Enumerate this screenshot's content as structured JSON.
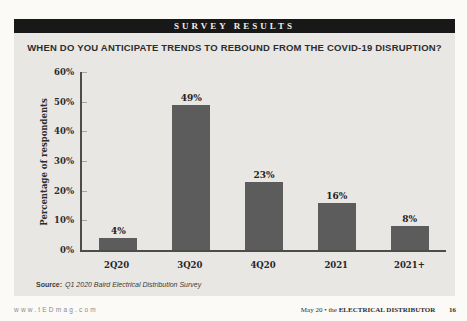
{
  "banner": {
    "label": "SURVEY RESULTS"
  },
  "chart_data": {
    "type": "bar",
    "title": "WHEN DO YOU ANTICIPATE TRENDS TO REBOUND FROM THE COVID-19 DISRUPTION?",
    "categories": [
      "2Q20",
      "3Q20",
      "4Q20",
      "2021",
      "2021+"
    ],
    "values": [
      4,
      49,
      23,
      16,
      8
    ],
    "value_labels": [
      "4%",
      "49%",
      "23%",
      "16%",
      "8%"
    ],
    "xlabel": "",
    "ylabel": "Percentage of respondents",
    "ylim": [
      0,
      60
    ],
    "yticks": [
      "0%",
      "10%",
      "20%",
      "30%",
      "40%",
      "50%",
      "60%"
    ],
    "grid": false,
    "legend": "none"
  },
  "source": {
    "label": "Source:",
    "text": "Q1 2020 Baird Electrical Distribution Survey"
  },
  "footer": {
    "website": "www.tEDmag.com",
    "issue": "May 20",
    "separator": "•",
    "magazine_prefix": "the",
    "magazine_name": "ELECTRICAL DISTRIBUTOR",
    "page_number": "16"
  },
  "colors": {
    "page_bg": "#fbfaf7",
    "card_bg": "#e9e7e3",
    "banner_bg": "#181818",
    "banner_text": "#f1efe9",
    "bar": "#5c5c5c",
    "axis": "#4c4c4c",
    "text": "#2b2b2b"
  }
}
